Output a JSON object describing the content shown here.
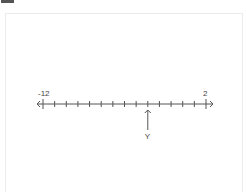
{
  "number_line": {
    "min": -12,
    "max": 2,
    "step": 1,
    "min_label": "-12",
    "max_label": "2",
    "marker": {
      "label": "Y",
      "value": -3
    }
  },
  "colors": {
    "line": "#555555",
    "text": "#444444",
    "card_border": "#ececec"
  }
}
